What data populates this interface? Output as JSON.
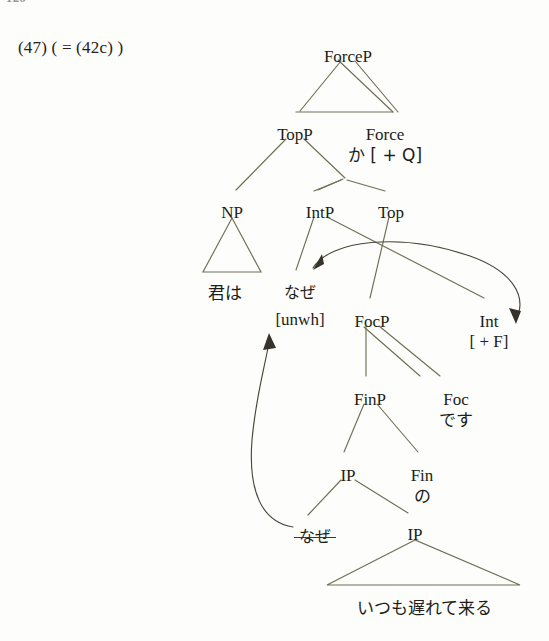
{
  "page": {
    "folio": "126",
    "example_number": "(47) ( = (42c) )"
  },
  "tree": {
    "nodes": [
      {
        "id": "forcep",
        "label": "ForceP",
        "x": 348,
        "y": 47
      },
      {
        "id": "topp",
        "label": "TopP",
        "x": 295,
        "y": 125
      },
      {
        "id": "force",
        "label": "Force",
        "x": 385,
        "y": 125,
        "sub": "か [ + Q]"
      },
      {
        "id": "np",
        "label": "NP",
        "x": 232,
        "y": 203
      },
      {
        "id": "intp",
        "label": "IntP",
        "x": 320,
        "y": 203
      },
      {
        "id": "top",
        "label": "Top",
        "x": 391,
        "y": 203
      },
      {
        "id": "int",
        "label": "Int",
        "x": 489,
        "y": 312,
        "sub": "[ + F]"
      },
      {
        "id": "focp",
        "label": "FocP",
        "x": 372,
        "y": 312
      },
      {
        "id": "finp",
        "label": "FinP",
        "x": 370,
        "y": 390
      },
      {
        "id": "foc",
        "label": "Foc",
        "x": 456,
        "y": 390,
        "sub": "です"
      },
      {
        "id": "ip_up",
        "label": "IP",
        "x": 348,
        "y": 466
      },
      {
        "id": "fin",
        "label": "Fin",
        "x": 422,
        "y": 466,
        "sub": "の"
      },
      {
        "id": "ip_low",
        "label": "IP",
        "x": 415,
        "y": 525
      }
    ],
    "terminals": [
      {
        "id": "kimi-wa",
        "text": "君は",
        "x": 225,
        "y": 283,
        "script": "jp"
      },
      {
        "id": "naze-unwh-word",
        "text": "なぜ",
        "x": 300,
        "y": 283,
        "script": "jp"
      },
      {
        "id": "naze-unwh-feature",
        "text": "[unwh]",
        "x": 300,
        "y": 308,
        "script": "latin"
      },
      {
        "id": "naze-trace",
        "text": "なぜ",
        "x": 315,
        "y": 527,
        "script": "jp",
        "struck": true
      },
      {
        "id": "itsumo",
        "text": "いつも遅れて来る",
        "x": 424,
        "y": 600,
        "script": "jp"
      }
    ],
    "annotations": [
      {
        "id": "agree-arrow",
        "from": "Int [ + F]",
        "to": "なぜ [unwh]",
        "kind": "agree"
      },
      {
        "id": "movement-arrow",
        "from": "なぜ (trace)",
        "to": "なぜ [unwh]",
        "kind": "movement"
      }
    ]
  },
  "colors": {
    "ink": "#211d16",
    "branch": "#6f6e56",
    "arrow": "#4a4738",
    "page_background": "#fdfdfb"
  }
}
